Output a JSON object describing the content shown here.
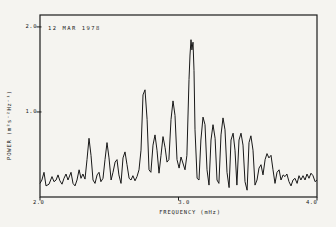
{
  "figure": {
    "background_color": "#f5f4f0",
    "line_color": "#191919",
    "axis_color": "#1c1c1c"
  },
  "chart_data": {
    "type": "line",
    "title": "12 MAR 1978",
    "xlabel": "FREQUENCY (mHz)",
    "ylabel": "POWER (m²s⁻²Hz⁻¹)",
    "xlim": [
      2.0,
      4.0
    ],
    "ylim": [
      0,
      2.14
    ],
    "x_ticks": [
      2.0,
      3.0,
      4.0
    ],
    "x_tick_labels": [
      "2.0",
      "3.0",
      "4.0"
    ],
    "y_ticks": [
      1.0,
      2.0
    ],
    "y_tick_labels": [
      "1.0",
      "2.0"
    ],
    "grid": false,
    "legend": null,
    "series_name": "power spectrum",
    "points": [
      [
        2.0,
        0.16
      ],
      [
        2.014,
        0.2
      ],
      [
        2.029,
        0.29
      ],
      [
        2.043,
        0.13
      ],
      [
        2.065,
        0.15
      ],
      [
        2.087,
        0.24
      ],
      [
        2.101,
        0.18
      ],
      [
        2.116,
        0.2
      ],
      [
        2.13,
        0.26
      ],
      [
        2.144,
        0.19
      ],
      [
        2.159,
        0.15
      ],
      [
        2.173,
        0.22
      ],
      [
        2.188,
        0.27
      ],
      [
        2.202,
        0.2
      ],
      [
        2.224,
        0.29
      ],
      [
        2.238,
        0.16
      ],
      [
        2.253,
        0.13
      ],
      [
        2.267,
        0.2
      ],
      [
        2.282,
        0.32
      ],
      [
        2.296,
        0.22
      ],
      [
        2.31,
        0.27
      ],
      [
        2.325,
        0.21
      ],
      [
        2.339,
        0.44
      ],
      [
        2.354,
        0.69
      ],
      [
        2.368,
        0.49
      ],
      [
        2.383,
        0.2
      ],
      [
        2.397,
        0.16
      ],
      [
        2.412,
        0.26
      ],
      [
        2.426,
        0.29
      ],
      [
        2.44,
        0.18
      ],
      [
        2.455,
        0.22
      ],
      [
        2.469,
        0.44
      ],
      [
        2.484,
        0.64
      ],
      [
        2.498,
        0.46
      ],
      [
        2.513,
        0.2
      ],
      [
        2.527,
        0.29
      ],
      [
        2.542,
        0.41
      ],
      [
        2.556,
        0.44
      ],
      [
        2.57,
        0.26
      ],
      [
        2.585,
        0.16
      ],
      [
        2.599,
        0.46
      ],
      [
        2.614,
        0.53
      ],
      [
        2.628,
        0.38
      ],
      [
        2.643,
        0.22
      ],
      [
        2.657,
        0.2
      ],
      [
        2.671,
        0.25
      ],
      [
        2.686,
        0.19
      ],
      [
        2.7,
        0.24
      ],
      [
        2.715,
        0.32
      ],
      [
        2.729,
        0.55
      ],
      [
        2.744,
        1.2
      ],
      [
        2.758,
        1.26
      ],
      [
        2.773,
        0.91
      ],
      [
        2.787,
        0.32
      ],
      [
        2.801,
        0.29
      ],
      [
        2.816,
        0.61
      ],
      [
        2.83,
        0.73
      ],
      [
        2.845,
        0.55
      ],
      [
        2.859,
        0.28
      ],
      [
        2.874,
        0.49
      ],
      [
        2.888,
        0.71
      ],
      [
        2.903,
        0.58
      ],
      [
        2.917,
        0.41
      ],
      [
        2.931,
        0.44
      ],
      [
        2.946,
        0.91
      ],
      [
        2.96,
        1.13
      ],
      [
        2.975,
        0.96
      ],
      [
        2.989,
        0.44
      ],
      [
        3.004,
        0.34
      ],
      [
        3.018,
        0.47
      ],
      [
        3.032,
        0.4
      ],
      [
        3.047,
        0.32
      ],
      [
        3.061,
        0.49
      ],
      [
        3.076,
        1.38
      ],
      [
        3.083,
        1.67
      ],
      [
        3.09,
        1.85
      ],
      [
        3.097,
        1.73
      ],
      [
        3.105,
        1.82
      ],
      [
        3.112,
        1.49
      ],
      [
        3.119,
        0.79
      ],
      [
        3.134,
        0.22
      ],
      [
        3.148,
        0.2
      ],
      [
        3.162,
        0.67
      ],
      [
        3.177,
        0.94
      ],
      [
        3.191,
        0.85
      ],
      [
        3.206,
        0.32
      ],
      [
        3.22,
        0.14
      ],
      [
        3.235,
        0.67
      ],
      [
        3.249,
        0.85
      ],
      [
        3.264,
        0.69
      ],
      [
        3.278,
        0.2
      ],
      [
        3.292,
        0.16
      ],
      [
        3.307,
        0.73
      ],
      [
        3.321,
        0.93
      ],
      [
        3.336,
        0.79
      ],
      [
        3.35,
        0.29
      ],
      [
        3.365,
        0.11
      ],
      [
        3.379,
        0.67
      ],
      [
        3.394,
        0.75
      ],
      [
        3.408,
        0.55
      ],
      [
        3.422,
        0.14
      ],
      [
        3.437,
        0.67
      ],
      [
        3.451,
        0.75
      ],
      [
        3.466,
        0.61
      ],
      [
        3.48,
        0.18
      ],
      [
        3.495,
        0.08
      ],
      [
        3.509,
        0.64
      ],
      [
        3.523,
        0.72
      ],
      [
        3.538,
        0.55
      ],
      [
        3.552,
        0.14
      ],
      [
        3.567,
        0.2
      ],
      [
        3.581,
        0.34
      ],
      [
        3.596,
        0.38
      ],
      [
        3.61,
        0.26
      ],
      [
        3.625,
        0.44
      ],
      [
        3.639,
        0.51
      ],
      [
        3.653,
        0.46
      ],
      [
        3.668,
        0.49
      ],
      [
        3.682,
        0.32
      ],
      [
        3.697,
        0.16
      ],
      [
        3.711,
        0.29
      ],
      [
        3.726,
        0.32
      ],
      [
        3.74,
        0.2
      ],
      [
        3.755,
        0.26
      ],
      [
        3.769,
        0.24
      ],
      [
        3.783,
        0.27
      ],
      [
        3.798,
        0.18
      ],
      [
        3.812,
        0.13
      ],
      [
        3.827,
        0.2
      ],
      [
        3.841,
        0.22
      ],
      [
        3.856,
        0.16
      ],
      [
        3.87,
        0.25
      ],
      [
        3.884,
        0.2
      ],
      [
        3.899,
        0.25
      ],
      [
        3.913,
        0.2
      ],
      [
        3.928,
        0.27
      ],
      [
        3.942,
        0.22
      ],
      [
        3.957,
        0.28
      ],
      [
        3.971,
        0.25
      ],
      [
        3.986,
        0.18
      ],
      [
        4.0,
        0.2
      ]
    ],
    "plot_frame_px": {
      "left": 40,
      "top": 15,
      "right": 317,
      "bottom": 197
    }
  }
}
